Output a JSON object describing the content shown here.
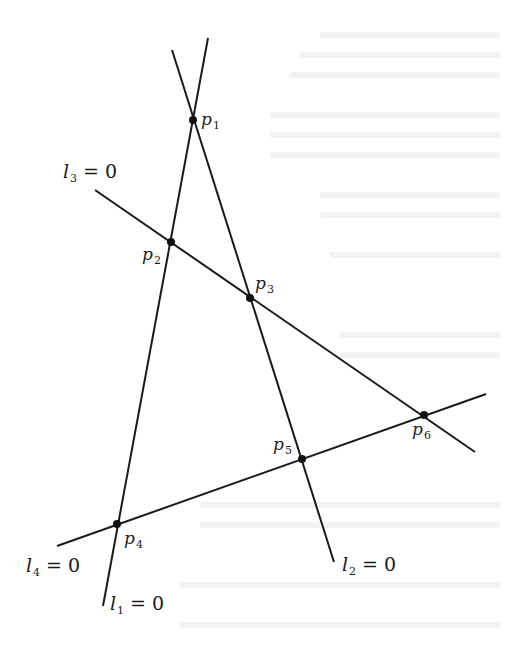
{
  "figure": {
    "stroke_color": "#1a1a1a",
    "point_color": "#111111",
    "lines": [
      {
        "id": "l1",
        "name": "l",
        "sub": "1",
        "eq": "=",
        "value": "0",
        "x1": 208,
        "y1": 38,
        "x2": 103,
        "y2": 606
      },
      {
        "id": "l2",
        "name": "l",
        "sub": "2",
        "eq": "=",
        "value": "0",
        "x1": 172,
        "y1": 50,
        "x2": 334,
        "y2": 562
      },
      {
        "id": "l3",
        "name": "l",
        "sub": "3",
        "eq": "=",
        "value": "0",
        "x1": 95,
        "y1": 190,
        "x2": 475,
        "y2": 452
      },
      {
        "id": "l4",
        "name": "l",
        "sub": "4",
        "eq": "=",
        "value": "0",
        "x1": 57,
        "y1": 546,
        "x2": 486,
        "y2": 394
      }
    ],
    "points": [
      {
        "id": "p1",
        "name": "p",
        "sub": "1",
        "x": 193,
        "y": 120
      },
      {
        "id": "p2",
        "name": "p",
        "sub": "2",
        "x": 171,
        "y": 242
      },
      {
        "id": "p3",
        "name": "p",
        "sub": "3",
        "x": 250,
        "y": 298
      },
      {
        "id": "p4",
        "name": "p",
        "sub": "4",
        "x": 117,
        "y": 524
      },
      {
        "id": "p5",
        "name": "p",
        "sub": "5",
        "x": 302,
        "y": 459
      },
      {
        "id": "p6",
        "name": "p",
        "sub": "6",
        "x": 424,
        "y": 415
      }
    ],
    "line_labels": {
      "l1": {
        "name": "l",
        "sub": "1",
        "eq": "=",
        "value": "0"
      },
      "l2": {
        "name": "l",
        "sub": "2",
        "eq": "=",
        "value": "0"
      },
      "l3": {
        "name": "l",
        "sub": "3",
        "eq": "=",
        "value": "0"
      },
      "l4": {
        "name": "l",
        "sub": "4",
        "eq": "=",
        "value": "0"
      }
    },
    "point_labels": {
      "p1": {
        "name": "p",
        "sub": "1"
      },
      "p2": {
        "name": "p",
        "sub": "2"
      },
      "p3": {
        "name": "p",
        "sub": "3"
      },
      "p4": {
        "name": "p",
        "sub": "4"
      },
      "p5": {
        "name": "p",
        "sub": "5"
      },
      "p6": {
        "name": "p",
        "sub": "6"
      }
    }
  }
}
